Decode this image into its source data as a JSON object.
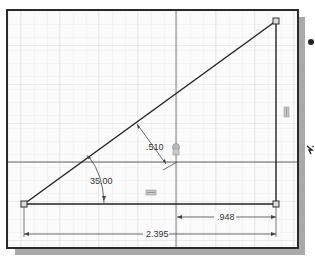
{
  "sketch": {
    "dimensions": {
      "angle": "35.00",
      "offset": ".510",
      "horizontal_short": ".948",
      "horizontal_long": "2.395"
    },
    "colors": {
      "line": "#222222",
      "grid_minor": "#e3e3e3",
      "grid_major": "#cfcfcf",
      "axis": "#555555",
      "dimension": "#444444",
      "background": "#fbfbfb",
      "shadow": "#a9a9a9"
    },
    "icons": [
      "constraint-glyph-vertical",
      "constraint-glyph-horizontal",
      "constraint-glyph-coincident",
      "bullet-icon",
      "cursor-icon"
    ]
  }
}
